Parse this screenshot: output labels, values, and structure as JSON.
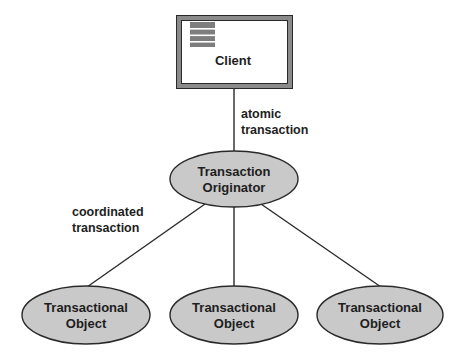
{
  "diagram": {
    "colors": {
      "node_fill": "#c9c9c9",
      "stroke": "#2a2a2a",
      "frame_gray": "#8a8a8a",
      "text": "#1e1e1e"
    },
    "client": {
      "label": "Client",
      "icon": "window-menu-icon"
    },
    "originator": {
      "line1": "Transaction",
      "line2": "Originator"
    },
    "objects": [
      {
        "line1": "Transactional",
        "line2": "Object"
      },
      {
        "line1": "Transactional",
        "line2": "Object"
      },
      {
        "line1": "Transactional",
        "line2": "Object"
      }
    ],
    "edges": {
      "client_to_originator": {
        "line1": "atomic",
        "line2": "transaction"
      },
      "originator_to_objects": {
        "line1": "coordinated",
        "line2": "transaction"
      }
    }
  }
}
